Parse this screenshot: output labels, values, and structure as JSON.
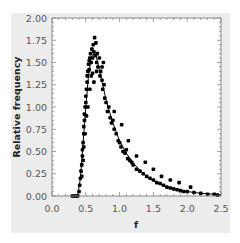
{
  "chart_data": {
    "type": "scatter",
    "title": "",
    "xlabel": "f",
    "ylabel": "Relative frequency",
    "xlim": [
      0.0,
      2.5
    ],
    "ylim": [
      0.0,
      2.0
    ],
    "x_ticks": [
      "0.0",
      "0.5",
      "1.0",
      "1.5",
      "2.0",
      "2.5"
    ],
    "y_ticks": [
      "0.00",
      "0.25",
      "0.50",
      "0.75",
      "1.00",
      "1.25",
      "1.50",
      "1.75",
      "2.00"
    ],
    "grid": false,
    "legend": null,
    "series": [
      {
        "name": "observed",
        "style": "scatter",
        "color": "#000000",
        "points": [
          [
            0.3,
            0.0
          ],
          [
            0.33,
            0.0
          ],
          [
            0.36,
            0.0
          ],
          [
            0.38,
            0.0
          ],
          [
            0.4,
            0.05
          ],
          [
            0.41,
            0.12
          ],
          [
            0.42,
            0.2
          ],
          [
            0.43,
            0.28
          ],
          [
            0.44,
            0.35
          ],
          [
            0.45,
            0.45
          ],
          [
            0.45,
            0.52
          ],
          [
            0.46,
            0.6
          ],
          [
            0.47,
            0.7
          ],
          [
            0.47,
            0.78
          ],
          [
            0.48,
            0.85
          ],
          [
            0.48,
            0.92
          ],
          [
            0.49,
            1.0
          ],
          [
            0.5,
            1.05
          ],
          [
            0.5,
            1.12
          ],
          [
            0.51,
            1.2
          ],
          [
            0.52,
            1.28
          ],
          [
            0.52,
            1.35
          ],
          [
            0.53,
            1.4
          ],
          [
            0.54,
            1.48
          ],
          [
            0.55,
            1.52
          ],
          [
            0.56,
            1.55
          ],
          [
            0.57,
            1.6
          ],
          [
            0.58,
            1.5
          ],
          [
            0.59,
            1.65
          ],
          [
            0.6,
            1.55
          ],
          [
            0.61,
            1.7
          ],
          [
            0.62,
            1.62
          ],
          [
            0.63,
            1.78
          ],
          [
            0.64,
            1.58
          ],
          [
            0.65,
            1.72
          ],
          [
            0.66,
            1.5
          ],
          [
            0.67,
            1.6
          ],
          [
            0.68,
            1.45
          ],
          [
            0.7,
            1.55
          ],
          [
            0.71,
            1.35
          ],
          [
            0.72,
            1.4
          ],
          [
            0.74,
            1.3
          ],
          [
            0.75,
            1.2
          ],
          [
            0.77,
            1.25
          ],
          [
            0.78,
            1.1
          ],
          [
            0.8,
            1.05
          ],
          [
            0.82,
            0.95
          ],
          [
            0.84,
            1.0
          ],
          [
            0.86,
            0.88
          ],
          [
            0.88,
            0.82
          ],
          [
            0.9,
            0.85
          ],
          [
            0.92,
            0.75
          ],
          [
            0.95,
            0.7
          ],
          [
            0.98,
            0.62
          ],
          [
            1.0,
            0.6
          ],
          [
            1.02,
            0.55
          ],
          [
            1.05,
            0.5
          ],
          [
            1.08,
            0.48
          ],
          [
            1.1,
            0.52
          ],
          [
            1.12,
            0.42
          ],
          [
            1.15,
            0.4
          ],
          [
            1.18,
            0.38
          ],
          [
            1.2,
            0.35
          ],
          [
            1.25,
            0.3
          ],
          [
            1.3,
            0.28
          ],
          [
            1.35,
            0.25
          ],
          [
            1.4,
            0.22
          ],
          [
            1.45,
            0.2
          ],
          [
            1.5,
            0.18
          ],
          [
            1.55,
            0.15
          ],
          [
            1.6,
            0.14
          ],
          [
            1.65,
            0.12
          ],
          [
            1.7,
            0.1
          ],
          [
            1.75,
            0.09
          ],
          [
            1.8,
            0.08
          ],
          [
            1.85,
            0.07
          ],
          [
            1.9,
            0.06
          ],
          [
            1.95,
            0.05
          ],
          [
            2.0,
            0.05
          ],
          [
            2.1,
            0.04
          ],
          [
            2.2,
            0.03
          ],
          [
            2.3,
            0.02
          ],
          [
            2.4,
            0.02
          ],
          [
            2.45,
            0.01
          ],
          [
            0.55,
            1.42
          ],
          [
            0.58,
            1.35
          ],
          [
            0.6,
            1.38
          ],
          [
            0.62,
            1.28
          ],
          [
            0.56,
            1.2
          ],
          [
            0.53,
            1.0
          ],
          [
            0.51,
            0.9
          ],
          [
            0.49,
            0.7
          ],
          [
            0.47,
            0.55
          ],
          [
            0.46,
            0.4
          ],
          [
            0.44,
            0.22
          ],
          [
            0.76,
            1.5
          ],
          [
            0.74,
            1.45
          ],
          [
            0.66,
            1.4
          ],
          [
            0.92,
            0.95
          ],
          [
            1.03,
            0.8
          ],
          [
            1.13,
            0.62
          ],
          [
            1.25,
            0.45
          ],
          [
            1.38,
            0.38
          ],
          [
            1.5,
            0.3
          ],
          [
            1.62,
            0.22
          ],
          [
            1.75,
            0.18
          ],
          [
            1.88,
            0.15
          ],
          [
            2.05,
            0.1
          ]
        ]
      },
      {
        "name": "fit",
        "style": "line",
        "color": "#000000",
        "points": [
          [
            0.38,
            0.0
          ],
          [
            0.42,
            0.2
          ],
          [
            0.46,
            0.6
          ],
          [
            0.5,
            1.0
          ],
          [
            0.54,
            1.35
          ],
          [
            0.58,
            1.55
          ],
          [
            0.62,
            1.6
          ],
          [
            0.66,
            1.55
          ],
          [
            0.7,
            1.42
          ],
          [
            0.75,
            1.25
          ],
          [
            0.8,
            1.08
          ],
          [
            0.9,
            0.82
          ],
          [
            1.0,
            0.62
          ],
          [
            1.1,
            0.48
          ],
          [
            1.2,
            0.37
          ],
          [
            1.3,
            0.29
          ],
          [
            1.4,
            0.22
          ],
          [
            1.5,
            0.17
          ],
          [
            1.6,
            0.13
          ],
          [
            1.7,
            0.1
          ],
          [
            1.8,
            0.08
          ],
          [
            1.9,
            0.06
          ],
          [
            2.0,
            0.05
          ],
          [
            2.2,
            0.03
          ],
          [
            2.4,
            0.02
          ],
          [
            2.5,
            0.01
          ]
        ]
      }
    ]
  }
}
